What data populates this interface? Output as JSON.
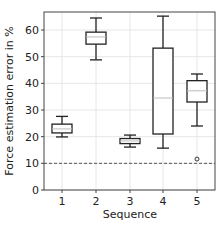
{
  "chart_data": {
    "type": "box",
    "title": "",
    "xlabel": "Sequence",
    "ylabel": "Force estimation error in %",
    "categories": [
      "1",
      "2",
      "3",
      "4",
      "5"
    ],
    "ylim": [
      0,
      67
    ],
    "yticks": [
      0,
      10,
      20,
      30,
      40,
      50,
      60
    ],
    "grid": true,
    "boxes": [
      {
        "label": "1",
        "whisker_low": 19.9,
        "q1": 21.4,
        "median": 22.9,
        "q3": 24.7,
        "whisker_high": 27.6,
        "outliers": []
      },
      {
        "label": "2",
        "whisker_low": 48.8,
        "q1": 54.7,
        "median": 57.4,
        "q3": 59.2,
        "whisker_high": 64.5,
        "outliers": []
      },
      {
        "label": "3",
        "whisker_low": 16.1,
        "q1": 17.4,
        "median": 18.4,
        "q3": 19.3,
        "whisker_high": 20.6,
        "outliers": []
      },
      {
        "label": "4",
        "whisker_low": 15.7,
        "q1": 21.0,
        "median": 34.5,
        "q3": 53.2,
        "whisker_high": 65.2,
        "outliers": []
      },
      {
        "label": "5",
        "whisker_low": 24.0,
        "q1": 33.0,
        "median": 37.2,
        "q3": 41.0,
        "whisker_high": 43.5,
        "outliers": [
          11.6
        ]
      }
    ],
    "reference_line": {
      "y": 10,
      "style": "dashed"
    }
  }
}
